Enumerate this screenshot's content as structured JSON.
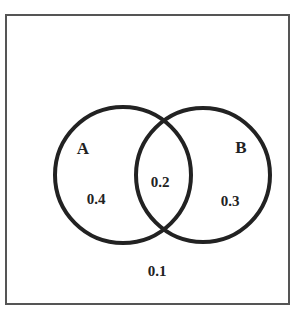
{
  "diagram": {
    "type": "venn",
    "sets": [
      {
        "name": "A",
        "only_value": "0.4"
      },
      {
        "name": "B",
        "only_value": "0.3"
      }
    ],
    "intersection_value": "0.2",
    "outside_value": "0.1",
    "colors": {
      "circle_stroke": "#222222",
      "frame_stroke": "#555555",
      "background": "#ffffff"
    }
  }
}
